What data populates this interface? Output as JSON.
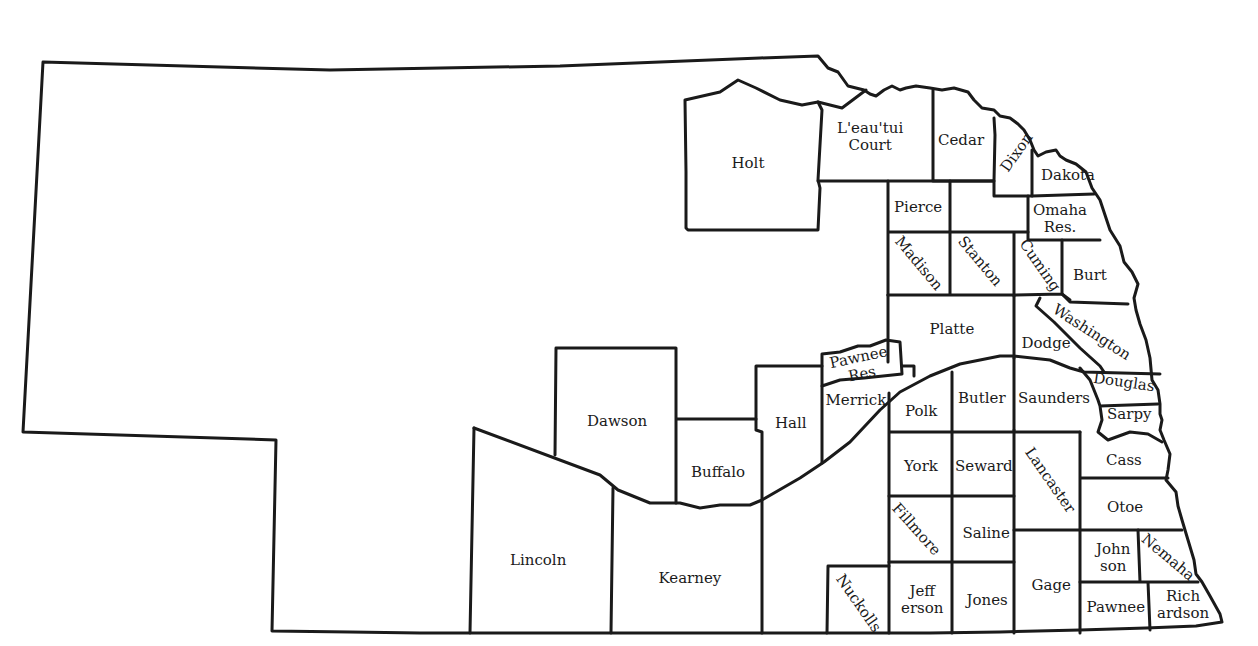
{
  "map": {
    "title": "",
    "stroke_color": "#1a1a1a",
    "background": "#ffffff",
    "counties": [
      {
        "id": "holt",
        "label": "Holt",
        "x": 748,
        "y": 163,
        "rot": 0
      },
      {
        "id": "leautui-court",
        "label": "L'eau'tui\nCourt",
        "x": 870,
        "y": 137,
        "rot": 0
      },
      {
        "id": "cedar",
        "label": "Cedar",
        "x": 961,
        "y": 140,
        "rot": 0
      },
      {
        "id": "dixon",
        "label": "Dixon",
        "x": 1017,
        "y": 152,
        "rot": -55
      },
      {
        "id": "dakota",
        "label": "Dakota",
        "x": 1068,
        "y": 175,
        "rot": 0
      },
      {
        "id": "pierce",
        "label": "Pierce",
        "x": 918,
        "y": 207,
        "rot": 0
      },
      {
        "id": "omaha-res",
        "label": "Omaha\nRes.",
        "x": 1060,
        "y": 219,
        "rot": 0
      },
      {
        "id": "madison",
        "label": "Madison",
        "x": 918,
        "y": 263,
        "rot": 50
      },
      {
        "id": "stanton",
        "label": "Stanton",
        "x": 980,
        "y": 261,
        "rot": 50
      },
      {
        "id": "cuming",
        "label": "Cuming",
        "x": 1039,
        "y": 265,
        "rot": 55
      },
      {
        "id": "burt",
        "label": "Burt",
        "x": 1090,
        "y": 275,
        "rot": 0
      },
      {
        "id": "platte",
        "label": "Platte",
        "x": 952,
        "y": 329,
        "rot": 0
      },
      {
        "id": "washington",
        "label": "Washington",
        "x": 1091,
        "y": 332,
        "rot": 33
      },
      {
        "id": "dodge",
        "label": "Dodge",
        "x": 1046,
        "y": 343,
        "rot": 0
      },
      {
        "id": "pawnee-res",
        "label": "Pawnee\nRes",
        "x": 860,
        "y": 366,
        "rot": -12
      },
      {
        "id": "douglas",
        "label": "Douglas",
        "x": 1124,
        "y": 382,
        "rot": 8
      },
      {
        "id": "merrick",
        "label": "Merrick",
        "x": 856,
        "y": 400,
        "rot": 0
      },
      {
        "id": "polk",
        "label": "Polk",
        "x": 921,
        "y": 411,
        "rot": 0
      },
      {
        "id": "butler",
        "label": "Butler",
        "x": 982,
        "y": 398,
        "rot": 0
      },
      {
        "id": "saunders",
        "label": "Saunders",
        "x": 1054,
        "y": 398,
        "rot": 0
      },
      {
        "id": "sarpy",
        "label": "Sarpy",
        "x": 1129,
        "y": 414,
        "rot": 0
      },
      {
        "id": "dawson",
        "label": "Dawson",
        "x": 617,
        "y": 421,
        "rot": 0
      },
      {
        "id": "hall",
        "label": "Hall",
        "x": 791,
        "y": 423,
        "rot": 0
      },
      {
        "id": "buffalo",
        "label": "Buffalo",
        "x": 718,
        "y": 472,
        "rot": 0
      },
      {
        "id": "york",
        "label": "York",
        "x": 921,
        "y": 466,
        "rot": 0
      },
      {
        "id": "seward",
        "label": "Seward",
        "x": 984,
        "y": 466,
        "rot": 0
      },
      {
        "id": "lancaster",
        "label": "Lancaster",
        "x": 1050,
        "y": 480,
        "rot": 55
      },
      {
        "id": "cass",
        "label": "Cass",
        "x": 1124,
        "y": 460,
        "rot": 0
      },
      {
        "id": "otoe",
        "label": "Otoe",
        "x": 1125,
        "y": 507,
        "rot": 0
      },
      {
        "id": "fillmore",
        "label": "Fillmore",
        "x": 916,
        "y": 529,
        "rot": 48
      },
      {
        "id": "saline",
        "label": "Saline",
        "x": 986,
        "y": 533,
        "rot": 0
      },
      {
        "id": "johnson",
        "label": "John\nson",
        "x": 1113,
        "y": 558,
        "rot": 0
      },
      {
        "id": "nemaha",
        "label": "Nemaha",
        "x": 1168,
        "y": 557,
        "rot": 40
      },
      {
        "id": "lincoln",
        "label": "Lincoln",
        "x": 538,
        "y": 560,
        "rot": 0
      },
      {
        "id": "kearney",
        "label": "Kearney",
        "x": 690,
        "y": 578,
        "rot": 0
      },
      {
        "id": "gage",
        "label": "Gage",
        "x": 1051,
        "y": 585,
        "rot": 0
      },
      {
        "id": "nuckolls",
        "label": "Nuckolls",
        "x": 858,
        "y": 603,
        "rot": 55
      },
      {
        "id": "jefferson",
        "label": "Jeff\nerson",
        "x": 922,
        "y": 600,
        "rot": 0
      },
      {
        "id": "jones",
        "label": "Jones",
        "x": 987,
        "y": 600,
        "rot": 0
      },
      {
        "id": "pawnee",
        "label": "Pawnee",
        "x": 1116,
        "y": 607,
        "rot": 0
      },
      {
        "id": "richardson",
        "label": "Rich\nardson",
        "x": 1183,
        "y": 605,
        "rot": 0
      }
    ]
  }
}
